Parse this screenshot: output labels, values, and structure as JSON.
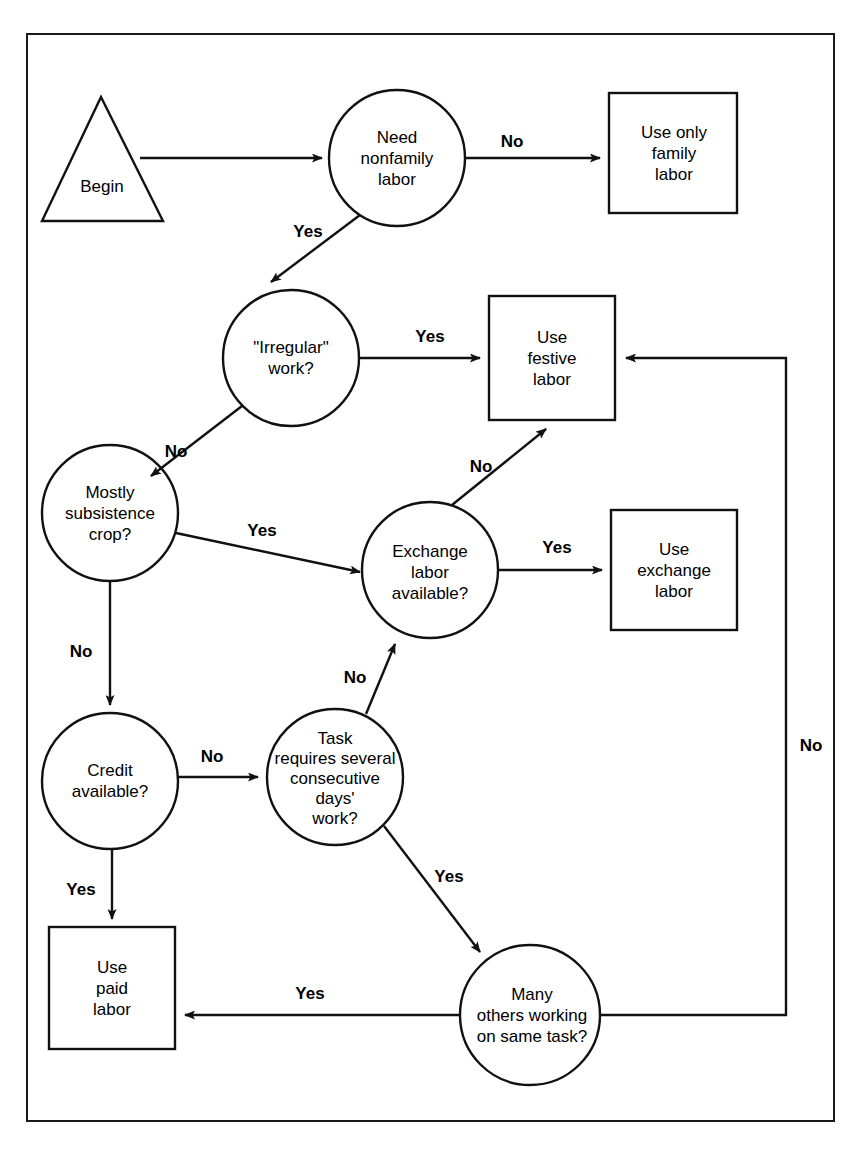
{
  "diagram": {
    "type": "flowchart",
    "title": "",
    "nodes": [
      {
        "id": "begin",
        "shape": "triangle",
        "label": "Begin",
        "cx": 102,
        "cy": 178
      },
      {
        "id": "need_nonfamily",
        "shape": "circle",
        "label": "Need\nnonfamily\nlabor",
        "cx": 397,
        "cy": 158,
        "r": 68
      },
      {
        "id": "use_only_family",
        "shape": "box",
        "label": "Use only\nfamily\nlabor",
        "cx": 674,
        "cy": 152
      },
      {
        "id": "irregular_work",
        "shape": "circle",
        "label": "\"Irregular\"\nwork?",
        "cx": 291,
        "cy": 358,
        "r": 68
      },
      {
        "id": "use_festive",
        "shape": "box",
        "label": "Use\nfestive\nlabor",
        "cx": 552,
        "cy": 358
      },
      {
        "id": "mostly_subsist",
        "shape": "circle",
        "label": "Mostly\nsubsistence\ncrop?",
        "cx": 110,
        "cy": 513,
        "r": 68
      },
      {
        "id": "exchange_avail",
        "shape": "circle",
        "label": "Exchange\nlabor\navailable?",
        "cx": 430,
        "cy": 570,
        "r": 68
      },
      {
        "id": "use_exchange",
        "shape": "box",
        "label": "Use\nexchange\nlabor",
        "cx": 674,
        "cy": 570
      },
      {
        "id": "credit_avail",
        "shape": "circle",
        "label": "Credit\navailable?",
        "cx": 110,
        "cy": 781,
        "r": 68
      },
      {
        "id": "task_consec",
        "shape": "circle",
        "label": "Task\nrequires several\nconsecutive\ndays'\nwork?",
        "cx": 335,
        "cy": 777,
        "r": 68
      },
      {
        "id": "use_paid",
        "shape": "box",
        "label": "Use\npaid\nlabor",
        "cx": 112,
        "cy": 987
      },
      {
        "id": "many_others",
        "shape": "circle",
        "label": "Many\nothers working\non same task?",
        "cx": 530,
        "cy": 1015,
        "r": 70
      }
    ],
    "edges": [
      {
        "from": "begin",
        "to": "need_nonfamily",
        "label": "",
        "label_x": 0,
        "label_y": 0
      },
      {
        "from": "need_nonfamily",
        "to": "use_only_family",
        "label": "No",
        "label_x": 512,
        "label_y": 142
      },
      {
        "from": "need_nonfamily",
        "to": "irregular_work",
        "label": "Yes",
        "label_x": 308,
        "label_y": 232
      },
      {
        "from": "irregular_work",
        "to": "use_festive",
        "label": "Yes",
        "label_x": 430,
        "label_y": 337
      },
      {
        "from": "irregular_work",
        "to": "mostly_subsist",
        "label": "No",
        "label_x": 176,
        "label_y": 452
      },
      {
        "from": "mostly_subsist",
        "to": "exchange_avail",
        "label": "Yes",
        "label_x": 262,
        "label_y": 531
      },
      {
        "from": "mostly_subsist",
        "to": "credit_avail",
        "label": "No",
        "label_x": 81,
        "label_y": 652
      },
      {
        "from": "exchange_avail",
        "to": "use_festive",
        "label": "No",
        "label_x": 481,
        "label_y": 467
      },
      {
        "from": "exchange_avail",
        "to": "use_exchange",
        "label": "Yes",
        "label_x": 557,
        "label_y": 548
      },
      {
        "from": "credit_avail",
        "to": "task_consec",
        "label": "No",
        "label_x": 212,
        "label_y": 757
      },
      {
        "from": "credit_avail",
        "to": "use_paid",
        "label": "Yes",
        "label_x": 81,
        "label_y": 890
      },
      {
        "from": "task_consec",
        "to": "exchange_avail",
        "label": "No",
        "label_x": 355,
        "label_y": 678
      },
      {
        "from": "task_consec",
        "to": "many_others",
        "label": "Yes",
        "label_x": 449,
        "label_y": 877
      },
      {
        "from": "many_others",
        "to": "use_paid",
        "label": "Yes",
        "label_x": 310,
        "label_y": 994
      },
      {
        "from": "many_others",
        "to": "use_festive",
        "label": "No",
        "label_x": 811,
        "label_y": 746
      }
    ],
    "colors": {
      "stroke": "#111111",
      "text": "#000000",
      "background": "#ffffff"
    }
  }
}
